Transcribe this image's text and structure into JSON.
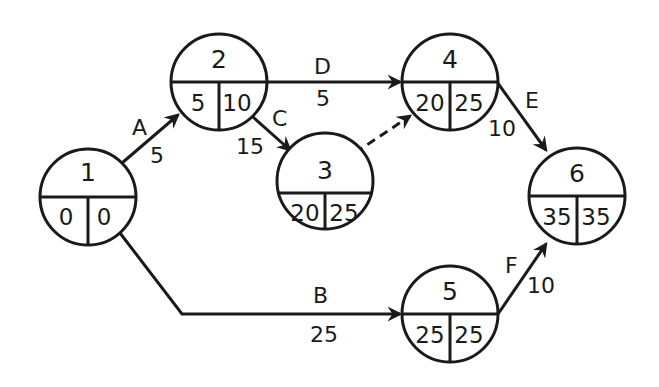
{
  "diagram": {
    "type": "activity-on-arrow network (CPM)",
    "nodes": [
      {
        "id": "1",
        "cx": 88,
        "cy": 197,
        "r": 48,
        "earliest": "0",
        "latest": "0"
      },
      {
        "id": "2",
        "cx": 219,
        "cy": 82,
        "r": 48,
        "earliest": "5",
        "latest": "10"
      },
      {
        "id": "3",
        "cx": 325,
        "cy": 181,
        "r": 48,
        "earliest": "20",
        "latest": "25"
      },
      {
        "id": "4",
        "cx": 450,
        "cy": 82,
        "r": 48,
        "earliest": "20",
        "latest": "25"
      },
      {
        "id": "5",
        "cx": 450,
        "cy": 314,
        "r": 48,
        "earliest": "25",
        "latest": "25"
      },
      {
        "id": "6",
        "cx": 577,
        "cy": 196,
        "r": 48,
        "earliest": "35",
        "latest": "35"
      }
    ],
    "edges": [
      {
        "activity": "A",
        "from": "1",
        "to": "2",
        "duration": "5",
        "dashed": false
      },
      {
        "activity": "D",
        "from": "2",
        "to": "4",
        "duration": "5",
        "dashed": false
      },
      {
        "activity": "C",
        "from": "2",
        "to": "3",
        "duration": "15",
        "dashed": false
      },
      {
        "activity": "",
        "from": "3",
        "to": "4",
        "duration": "",
        "dashed": true,
        "note": "dummy activity"
      },
      {
        "activity": "E",
        "from": "4",
        "to": "6",
        "duration": "10",
        "dashed": false
      },
      {
        "activity": "B",
        "from": "1",
        "to": "5",
        "duration": "25",
        "dashed": false
      },
      {
        "activity": "F",
        "from": "5",
        "to": "6",
        "duration": "10",
        "dashed": false
      }
    ]
  },
  "colors": {
    "stroke": "#1a1a1a",
    "background": "#ffffff"
  }
}
